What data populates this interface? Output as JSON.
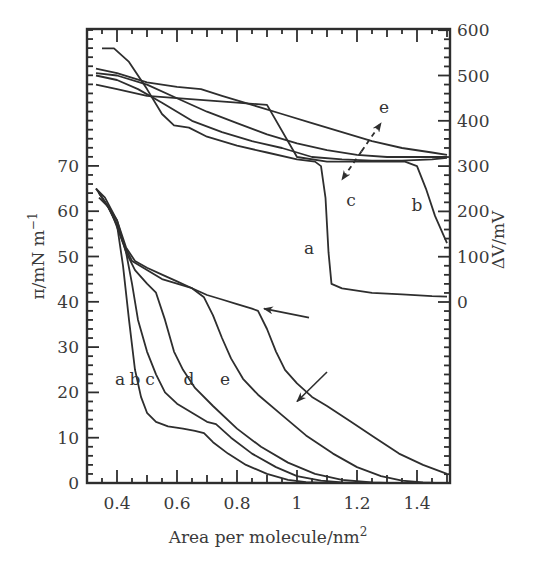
{
  "chart_data": {
    "type": "line",
    "title": "",
    "xlabel": "Area per molecule/nm²",
    "xlabel_base": "Area per molecule/nm",
    "xlabel_sup": "2",
    "ylabel_left": "π/mN m⁻¹",
    "ylabel_left_base": "π/mN m",
    "ylabel_left_sup": "−1",
    "ylabel_right": "ΔV/mV",
    "xlim": [
      0.3,
      1.51
    ],
    "ylim_left": [
      0,
      70
    ],
    "ylim_right": [
      0,
      600
    ],
    "grid": false,
    "legend": "inline curve letters",
    "x_ticks": [
      0.4,
      0.6,
      0.8,
      1,
      1.2,
      1.4
    ],
    "x_tick_labels": [
      "0.4",
      "0.6",
      "0.8",
      "1",
      "1.2",
      "1.4"
    ],
    "y_left_ticks": [
      0,
      10,
      20,
      30,
      40,
      50,
      60,
      70
    ],
    "y_left_tick_labels": [
      "0",
      "10",
      "20",
      "30",
      "40",
      "50",
      "60",
      "70"
    ],
    "y_right_ticks": [
      0,
      100,
      200,
      300,
      400,
      500,
      600
    ],
    "y_right_tick_labels": [
      "0",
      "100",
      "200",
      "300",
      "400",
      "500",
      "600"
    ],
    "pressure_series": [
      {
        "name": "a",
        "axis": "left",
        "points": [
          [
            0.34,
            63
          ],
          [
            0.37,
            61
          ],
          [
            0.4,
            57
          ],
          [
            0.42,
            48
          ],
          [
            0.44,
            36
          ],
          [
            0.46,
            25
          ],
          [
            0.48,
            19
          ],
          [
            0.5,
            15.5
          ],
          [
            0.53,
            13.5
          ],
          [
            0.57,
            12.5
          ],
          [
            0.62,
            12
          ],
          [
            0.66,
            11.5
          ],
          [
            0.69,
            11
          ],
          [
            0.72,
            9
          ],
          [
            0.77,
            6.5
          ],
          [
            0.83,
            4
          ],
          [
            0.9,
            2
          ],
          [
            0.97,
            0.7
          ],
          [
            1.03,
            0.2
          ],
          [
            1.1,
            0
          ]
        ]
      },
      {
        "name": "b",
        "axis": "left",
        "points": [
          [
            0.33,
            65
          ],
          [
            0.36,
            62
          ],
          [
            0.4,
            58
          ],
          [
            0.43,
            51
          ],
          [
            0.45,
            44
          ],
          [
            0.47,
            36
          ],
          [
            0.5,
            29
          ],
          [
            0.53,
            24
          ],
          [
            0.56,
            20
          ],
          [
            0.6,
            17.5
          ],
          [
            0.65,
            15.5
          ],
          [
            0.7,
            13.5
          ],
          [
            0.73,
            13
          ],
          [
            0.78,
            10
          ],
          [
            0.85,
            6.5
          ],
          [
            0.93,
            3.5
          ],
          [
            1.0,
            1.5
          ],
          [
            1.08,
            0.5
          ],
          [
            1.15,
            0.1
          ],
          [
            1.2,
            0
          ]
        ]
      },
      {
        "name": "c",
        "axis": "left",
        "points": [
          [
            0.34,
            64
          ],
          [
            0.37,
            61
          ],
          [
            0.4,
            57
          ],
          [
            0.43,
            51
          ],
          [
            0.46,
            47
          ],
          [
            0.5,
            44
          ],
          [
            0.53,
            42
          ],
          [
            0.56,
            36
          ],
          [
            0.59,
            29
          ],
          [
            0.62,
            25
          ],
          [
            0.66,
            21
          ],
          [
            0.72,
            17
          ],
          [
            0.8,
            12
          ],
          [
            0.88,
            8
          ],
          [
            0.97,
            4.5
          ],
          [
            1.06,
            2
          ],
          [
            1.15,
            0.7
          ],
          [
            1.25,
            0.1
          ],
          [
            1.3,
            0
          ]
        ]
      },
      {
        "name": "d",
        "axis": "left",
        "points": [
          [
            0.34,
            64
          ],
          [
            0.38,
            60
          ],
          [
            0.42,
            53
          ],
          [
            0.45,
            49
          ],
          [
            0.5,
            47
          ],
          [
            0.55,
            45
          ],
          [
            0.6,
            44
          ],
          [
            0.65,
            43
          ],
          [
            0.69,
            41
          ],
          [
            0.72,
            37
          ],
          [
            0.75,
            32
          ],
          [
            0.78,
            27.5
          ],
          [
            0.82,
            23
          ],
          [
            0.87,
            19.5
          ],
          [
            0.95,
            15
          ],
          [
            1.03,
            10.5
          ],
          [
            1.12,
            6.5
          ],
          [
            1.2,
            3.5
          ],
          [
            1.28,
            1.5
          ],
          [
            1.35,
            0.5
          ],
          [
            1.42,
            0.1
          ],
          [
            1.46,
            0
          ]
        ]
      },
      {
        "name": "e",
        "axis": "left",
        "points": [
          [
            0.33,
            65
          ],
          [
            0.36,
            63
          ],
          [
            0.4,
            58
          ],
          [
            0.43,
            52
          ],
          [
            0.46,
            49
          ],
          [
            0.5,
            47.5
          ],
          [
            0.55,
            46
          ],
          [
            0.6,
            44.5
          ],
          [
            0.65,
            43
          ],
          [
            0.7,
            41.5
          ],
          [
            0.75,
            40.5
          ],
          [
            0.8,
            39.5
          ],
          [
            0.85,
            38.5
          ],
          [
            0.87,
            38
          ],
          [
            0.9,
            34
          ],
          [
            0.93,
            29
          ],
          [
            0.96,
            25
          ],
          [
            1.0,
            22
          ],
          [
            1.05,
            19
          ],
          [
            1.1,
            17
          ],
          [
            1.18,
            13.5
          ],
          [
            1.26,
            10
          ],
          [
            1.34,
            6.5
          ],
          [
            1.42,
            4
          ],
          [
            1.5,
            2
          ]
        ]
      }
    ],
    "potential_series": [
      {
        "name": "a",
        "axis": "right",
        "points": [
          [
            0.35,
            560
          ],
          [
            0.39,
            560
          ],
          [
            0.44,
            530
          ],
          [
            0.5,
            470
          ],
          [
            0.55,
            415
          ],
          [
            0.59,
            390
          ],
          [
            0.64,
            385
          ],
          [
            0.7,
            365
          ],
          [
            0.8,
            345
          ],
          [
            0.9,
            330
          ],
          [
            1.0,
            315
          ],
          [
            1.06,
            310
          ],
          [
            1.08,
            300
          ],
          [
            1.095,
            230
          ],
          [
            1.105,
            110
          ],
          [
            1.115,
            40
          ],
          [
            1.15,
            30
          ],
          [
            1.25,
            20
          ],
          [
            1.35,
            17
          ],
          [
            1.45,
            13
          ],
          [
            1.5,
            12
          ]
        ]
      },
      {
        "name": "b",
        "axis": "right",
        "points": [
          [
            0.33,
            480
          ],
          [
            0.4,
            470
          ],
          [
            0.5,
            455
          ],
          [
            0.6,
            450
          ],
          [
            0.7,
            445
          ],
          [
            0.8,
            440
          ],
          [
            0.9,
            435
          ],
          [
            1.0,
            320
          ],
          [
            1.1,
            310
          ],
          [
            1.2,
            310
          ],
          [
            1.3,
            310
          ],
          [
            1.36,
            310
          ],
          [
            1.4,
            300
          ],
          [
            1.43,
            250
          ],
          [
            1.46,
            190
          ],
          [
            1.5,
            130
          ]
        ]
      },
      {
        "name": "c",
        "axis": "right",
        "points": [
          [
            0.33,
            500
          ],
          [
            0.4,
            490
          ],
          [
            0.47,
            470
          ],
          [
            0.55,
            440
          ],
          [
            0.65,
            400
          ],
          [
            0.75,
            375
          ],
          [
            0.85,
            355
          ],
          [
            0.95,
            340
          ],
          [
            1.05,
            320
          ],
          [
            1.15,
            315
          ],
          [
            1.25,
            312
          ],
          [
            1.35,
            312
          ],
          [
            1.45,
            315
          ],
          [
            1.5,
            318
          ]
        ]
      },
      {
        "name": "d",
        "axis": "right",
        "points": [
          [
            0.33,
            505
          ],
          [
            0.4,
            500
          ],
          [
            0.5,
            480
          ],
          [
            0.6,
            450
          ],
          [
            0.7,
            420
          ],
          [
            0.8,
            395
          ],
          [
            0.9,
            370
          ],
          [
            1.0,
            350
          ],
          [
            1.1,
            335
          ],
          [
            1.2,
            325
          ],
          [
            1.3,
            320
          ],
          [
            1.4,
            320
          ],
          [
            1.5,
            320
          ]
        ]
      },
      {
        "name": "e",
        "axis": "right",
        "points": [
          [
            0.33,
            515
          ],
          [
            0.4,
            505
          ],
          [
            0.5,
            485
          ],
          [
            0.6,
            475
          ],
          [
            0.68,
            470
          ],
          [
            0.75,
            455
          ],
          [
            0.85,
            435
          ],
          [
            0.95,
            415
          ],
          [
            1.05,
            395
          ],
          [
            1.15,
            375
          ],
          [
            1.25,
            355
          ],
          [
            1.35,
            340
          ],
          [
            1.45,
            330
          ],
          [
            1.5,
            325
          ]
        ]
      }
    ],
    "annotations": {
      "pressure_labels": [
        {
          "text": "a",
          "x": 0.41,
          "y": 23
        },
        {
          "text": "b",
          "x": 0.46,
          "y": 23
        },
        {
          "text": "c",
          "x": 0.51,
          "y": 23
        },
        {
          "text": "d",
          "x": 0.64,
          "y": 23
        },
        {
          "text": "e",
          "x": 0.76,
          "y": 23
        }
      ],
      "potential_labels": [
        {
          "text": "a",
          "x": 1.04,
          "y_mV": 120
        },
        {
          "text": "b",
          "x": 1.4,
          "y_mV": 215
        },
        {
          "text": "c",
          "x": 1.18,
          "y_mV": 225
        },
        {
          "text": "e",
          "x": 1.29,
          "y_mV": 430
        }
      ],
      "arrows": [
        {
          "desc": "arrow pointing to knee of isotherm e",
          "from": [
            1.04,
            36.5
          ],
          "to": [
            0.89,
            38.5
          ]
        },
        {
          "desc": "arrow pointing to lower part of isotherm e",
          "from": [
            1.1,
            24.5
          ],
          "to": [
            1.0,
            18
          ]
        },
        {
          "desc": "dashed double arrow c to e on potential curves",
          "from": [
            1.15,
            270
          ],
          "to": [
            1.28,
            395
          ],
          "dashed": true
        }
      ]
    }
  }
}
